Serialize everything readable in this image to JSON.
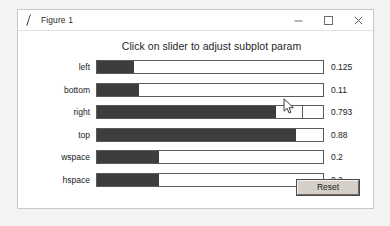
{
  "window": {
    "title": "Figure 1",
    "icon": "matplotlib-figure-icon",
    "controls": {
      "minimize_label": "Minimize",
      "maximize_label": "Maximize",
      "close_label": "Close"
    }
  },
  "figure": {
    "title": "Click on slider to adjust subplot param",
    "sliders": [
      {
        "label": "left",
        "value": "0.125",
        "fill_fraction": 0.165,
        "tick_fraction": null
      },
      {
        "label": "bottom",
        "value": "0.11",
        "fill_fraction": 0.185,
        "tick_fraction": null
      },
      {
        "label": "right",
        "value": "0.793",
        "fill_fraction": 0.793,
        "tick_fraction": 0.905
      },
      {
        "label": "top",
        "value": "0.88",
        "fill_fraction": 0.88,
        "tick_fraction": null
      },
      {
        "label": "wspace",
        "value": "0.2",
        "fill_fraction": 0.275,
        "tick_fraction": null
      },
      {
        "label": "hspace",
        "value": "0.2",
        "fill_fraction": 0.275,
        "tick_fraction": null
      }
    ],
    "reset_label": "Reset"
  },
  "colors": {
    "slider_fill": "#3d3d3d",
    "slider_track": "#ffffff",
    "slider_border": "#5a5a5a",
    "button_face": "#d4d0c8",
    "text": "#1a1a1a",
    "window_bg": "#ffffff"
  },
  "cursor": {
    "type": "arrow-pointer",
    "x": 283,
    "y": 98
  }
}
